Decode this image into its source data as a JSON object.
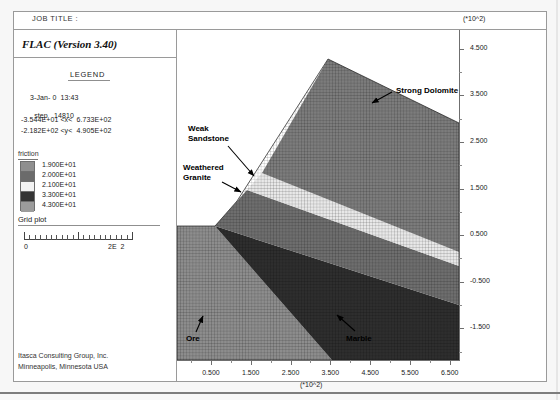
{
  "window": {
    "job_title_label": "JOB TITLE :",
    "app_title": "FLAC (Version 3.40)"
  },
  "legend": {
    "heading": "LEGEND",
    "date_time": "3-Jan- 0  13:43",
    "step_label": "step",
    "step_value": "14810",
    "x_range": "-3.544E+01 <x<  6.733E+02",
    "y_range": "-2.182E+02 <y<  4.905E+02",
    "friction_label": "friction",
    "friction_items": [
      {
        "value": "1.900E+01",
        "color": "#8f8f8f"
      },
      {
        "value": "2.000E+01",
        "color": "#6b6b6b"
      },
      {
        "value": "2.100E+01",
        "color": "#f2f2f2"
      },
      {
        "value": "3.300E+01",
        "color": "#343434"
      },
      {
        "value": "4.300E+01",
        "color": "#9c9c9c"
      }
    ],
    "grid_plot_label": "Grid plot",
    "scale_min": "0",
    "scale_max": "2E  2"
  },
  "footer": {
    "line1": "Itasca Consulting Group, Inc.",
    "line2": "Minneapolis, Minnesota  USA"
  },
  "chart_data": {
    "type": "heatmap",
    "xlabel": "(*10^2)",
    "ylabel": "(*10^2)",
    "x_exponent_label": "(*10^2)",
    "y_exponent_label": "(*10^2)",
    "xlim": [
      -0.354,
      6.733
    ],
    "ylim": [
      -2.182,
      4.905
    ],
    "x_ticks": [
      "0.500",
      "1.500",
      "2.500",
      "3.500",
      "4.500",
      "5.500",
      "6.500"
    ],
    "y_ticks": [
      "4.500",
      "3.500",
      "2.500",
      "1.500",
      "0.500",
      "-0.500",
      "-1.500"
    ],
    "grid": true,
    "legend_position": "left-panel",
    "series": [
      {
        "name": "Strong Dolomite",
        "friction": "4.300E+01",
        "color": "#7c7c7c"
      },
      {
        "name": "Weak Sandstone",
        "friction": "2.100E+01",
        "color": "#e8e8e8"
      },
      {
        "name": "Weathered Granite",
        "friction": "2.000E+01",
        "color": "#6e6e6e"
      },
      {
        "name": "Ore",
        "friction": "1.900E+01",
        "color": "#8d8d8d"
      },
      {
        "name": "Marble",
        "friction": "3.300E+01",
        "color": "#2e2e2e"
      }
    ],
    "annotations": [
      {
        "text": "Strong Dolomite",
        "x": 4.75,
        "y": 3.55
      },
      {
        "text": "Weak\nSandstone",
        "x": 0.45,
        "y": 2.35
      },
      {
        "text": "Weathered\nGranite",
        "x": 0.35,
        "y": 1.45
      },
      {
        "text": "Ore",
        "x": 0.3,
        "y": -1.45
      },
      {
        "text": "Marble",
        "x": 3.55,
        "y": -1.45
      }
    ]
  },
  "annotation_labels": {
    "strong_dolomite": "Strong Dolomite",
    "weak_sandstone_l1": "Weak",
    "weak_sandstone_l2": "Sandstone",
    "weathered_granite_l1": "Weathered",
    "weathered_granite_l2": "Granite",
    "ore": "Ore",
    "marble": "Marble"
  }
}
